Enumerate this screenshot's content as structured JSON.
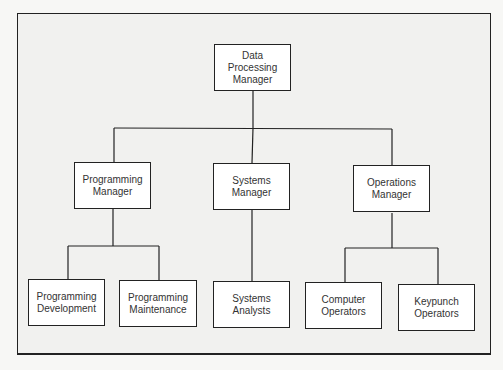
{
  "diagram": {
    "type": "org-chart",
    "root": {
      "label": "Data\nProcessing\nManager"
    },
    "managers": [
      {
        "label": "Programming\nManager"
      },
      {
        "label": "Systems\nManager"
      },
      {
        "label": "Operations\nManager"
      }
    ],
    "staff": [
      {
        "label": "Programming\nDevelopment",
        "reports_to": "Programming Manager"
      },
      {
        "label": "Programming\nMaintenance",
        "reports_to": "Programming Manager"
      },
      {
        "label": "Systems\nAnalysts",
        "reports_to": "Systems Manager"
      },
      {
        "label": "Computer\nOperators",
        "reports_to": "Operations Manager"
      },
      {
        "label": "Keypunch\nOperators",
        "reports_to": "Operations Manager"
      }
    ]
  }
}
